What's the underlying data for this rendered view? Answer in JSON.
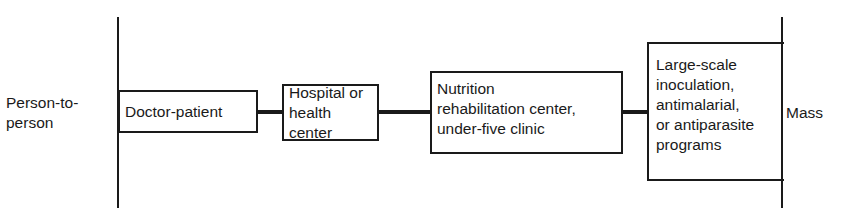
{
  "diagram": {
    "type": "continuum",
    "left_label": "Person-to-\nperson",
    "right_label": "Mass",
    "nodes": [
      {
        "id": "doctor-patient",
        "label": "Doctor-patient"
      },
      {
        "id": "hospital",
        "label": "Hospital or\nhealth center"
      },
      {
        "id": "nutrition",
        "label": "Nutrition\nrehabilitation center,\nunder-five clinic"
      },
      {
        "id": "large-scale",
        "label": "Large-scale\ninoculation,\nantimalarial,\nor antiparasite\nprograms"
      }
    ],
    "edges": [
      {
        "from": "doctor-patient",
        "to": "hospital"
      },
      {
        "from": "hospital",
        "to": "nutrition"
      },
      {
        "from": "nutrition",
        "to": "large-scale"
      }
    ],
    "colors": {
      "line": "#1a1a1a",
      "background": "#ffffff"
    }
  }
}
